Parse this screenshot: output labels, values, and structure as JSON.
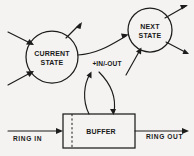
{
  "diagram": {
    "background_color": "#f4f3f1",
    "ink_color": "#1c1c1c",
    "nodes": [
      {
        "id": "current-state",
        "shape": "circle",
        "label_line1": "CURRENT",
        "label_line2": "STATE",
        "cx": 52,
        "cy": 57,
        "r": 26
      },
      {
        "id": "next-state",
        "shape": "circle",
        "label_line1": "NEXT",
        "label_line2": "STATE",
        "cx": 150,
        "cy": 30,
        "r": 22
      },
      {
        "id": "buffer",
        "shape": "rectangle",
        "label": "BUFFER",
        "x": 63,
        "y": 114,
        "width": 72,
        "height": 34
      }
    ],
    "edges": [
      {
        "id": "current-to-next",
        "from": "current-state",
        "to": "next-state",
        "label": "",
        "style": "curved-arrow"
      },
      {
        "id": "buffer-to-current",
        "from": "buffer",
        "to": "current-state",
        "label": "+IN/-OUT",
        "style": "curved-arrow-up"
      },
      {
        "id": "next-to-buffer",
        "from": "next-state",
        "to": "buffer",
        "label": "+IN/-OUT",
        "style": "curved-arrow-down"
      }
    ],
    "edge_labels": [
      {
        "id": "in-out-label",
        "text": "+IN/-OUT",
        "x": 107,
        "y": 66
      }
    ],
    "io_ports": [
      {
        "id": "ring-in",
        "text": "RING IN",
        "direction": "input",
        "x": 13,
        "y": 140
      },
      {
        "id": "ring-out",
        "text": "RING OUT",
        "direction": "output",
        "x": 146,
        "y": 138
      }
    ],
    "free_arrows": [
      {
        "id": "current-in-upper-left",
        "direction": "incoming",
        "target": "current-state"
      },
      {
        "id": "current-in-lower-left",
        "direction": "incoming",
        "target": "current-state"
      },
      {
        "id": "current-out-upper-right",
        "direction": "outgoing",
        "source": "current-state"
      },
      {
        "id": "next-out-upper-right",
        "direction": "outgoing",
        "source": "next-state"
      },
      {
        "id": "next-out-lower-right",
        "direction": "outgoing",
        "source": "next-state"
      },
      {
        "id": "next-in-lower-left",
        "direction": "incoming",
        "target": "next-state"
      }
    ]
  }
}
